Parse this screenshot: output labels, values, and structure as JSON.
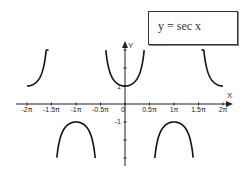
{
  "chart_data": {
    "type": "line",
    "title": "y = sec x",
    "legend": {
      "text": "y = sec x",
      "placement": "top-right"
    },
    "xlabel": "X",
    "ylabel": "Y",
    "xlim": [
      -6.2832,
      6.2832
    ],
    "ylim": [
      -3,
      3
    ],
    "grid": false,
    "x_ticks": [
      {
        "value": -6.2832,
        "label": "-2π"
      },
      {
        "value": -4.7124,
        "label": "-1.5π"
      },
      {
        "value": -3.1416,
        "label": "-1π"
      },
      {
        "value": -1.5708,
        "label": "-0.5π"
      },
      {
        "value": 0,
        "label": "0"
      },
      {
        "value": 1.5708,
        "label": "0.5π"
      },
      {
        "value": 3.1416,
        "label": "1π"
      },
      {
        "value": 4.7124,
        "label": "1.5π"
      },
      {
        "value": 6.2832,
        "label": "2π"
      }
    ],
    "y_ticks": [
      {
        "value": 1,
        "label": "1"
      },
      {
        "value": 2,
        "label": ""
      },
      {
        "value": 3,
        "label": ""
      },
      {
        "value": -1,
        "label": "-1"
      },
      {
        "value": -2,
        "label": ""
      },
      {
        "value": -3,
        "label": ""
      }
    ],
    "series": [
      {
        "name": "sec x",
        "function": "sec",
        "color": "#111111",
        "branches": [
          {
            "x_range": [
              -6.2832,
              -4.9
            ],
            "sign": 1
          },
          {
            "x_range": [
              -4.37,
              -1.91
            ],
            "sign": -1
          },
          {
            "x_range": [
              -1.23,
              1.23
            ],
            "sign": 1
          },
          {
            "x_range": [
              1.91,
              4.37
            ],
            "sign": -1
          },
          {
            "x_range": [
              4.9,
              6.2832
            ],
            "sign": 1
          }
        ]
      }
    ]
  },
  "colors": {
    "axis": "#222222",
    "curve": "#111111"
  }
}
